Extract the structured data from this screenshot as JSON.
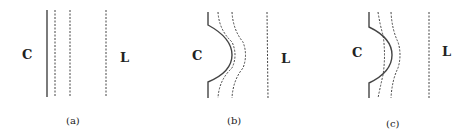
{
  "figure": {
    "panels": [
      {
        "id": "a",
        "caption": "(a)",
        "left_label": "C",
        "right_label": "L",
        "description": "straight boundary with parallel dashed lines"
      },
      {
        "id": "b",
        "caption": "(b)",
        "left_label": "C",
        "right_label": "L",
        "description": "bulged boundary with dashed lines following the bulge"
      },
      {
        "id": "c",
        "caption": "(c)",
        "left_label": "C",
        "right_label": "L",
        "description": "bulged boundary with dashed lines crossing the bulge"
      }
    ],
    "colors": {
      "line": "#333333",
      "text": "#222222",
      "background": "#ffffff"
    }
  }
}
